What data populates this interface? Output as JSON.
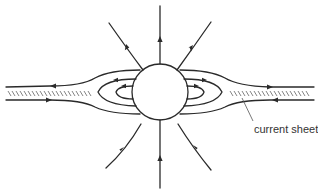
{
  "figure": {
    "type": "field-line diagram",
    "colors": {
      "ink": "#2a2a2a",
      "hatch": "#666666",
      "background": "#ffffff"
    },
    "body": {
      "shape": "circle",
      "center": [
        160,
        92
      ],
      "radius": 28
    },
    "radial_lines": {
      "upper": {
        "count": 3,
        "direction": "outward"
      },
      "lower": {
        "count": 3,
        "direction": "inward"
      }
    },
    "closed_loops": {
      "per_side": 2
    },
    "current_sheets": [
      {
        "side": "left",
        "upper_flow": "leftward",
        "lower_flow": "rightward"
      },
      {
        "side": "right",
        "upper_flow": "rightward",
        "lower_flow": "leftward"
      }
    ],
    "labels": {
      "current_sheet": "current sheet"
    }
  }
}
